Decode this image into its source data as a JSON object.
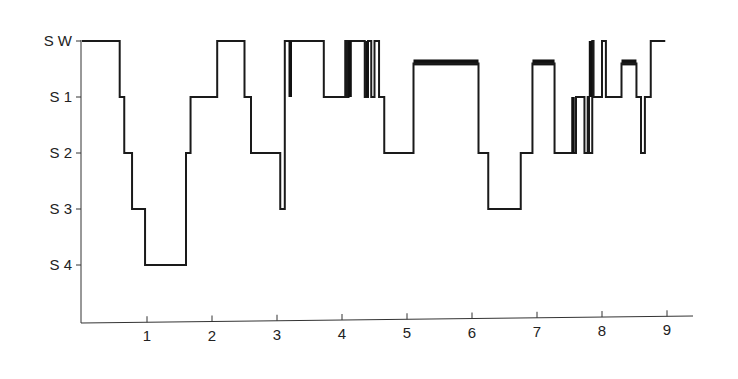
{
  "chart_data": {
    "type": "line",
    "subtype": "step (hypnogram)",
    "title": "",
    "xlabel": "",
    "ylabel": "",
    "x_ticks": [
      1,
      2,
      3,
      4,
      5,
      6,
      7,
      8,
      9
    ],
    "xlim": [
      0,
      9.3
    ],
    "y_categories": [
      "S W",
      "S 1",
      "S 2",
      "S 3",
      "S 4"
    ],
    "y_levels": {
      "S W": 0,
      "S 1": 1,
      "S 2": 2,
      "S 3": 3,
      "S 4": 4
    },
    "grid": false,
    "legend": null,
    "series": [
      {
        "name": "sleep stage",
        "color": "#1a1a1a",
        "steps": [
          [
            0.0,
            0
          ],
          [
            0.58,
            1
          ],
          [
            0.65,
            2
          ],
          [
            0.77,
            3
          ],
          [
            0.97,
            4
          ],
          [
            1.6,
            2
          ],
          [
            1.67,
            1
          ],
          [
            2.08,
            0
          ],
          [
            2.5,
            1
          ],
          [
            2.6,
            2
          ],
          [
            3.05,
            3
          ],
          [
            3.12,
            0
          ],
          [
            3.72,
            1
          ],
          [
            4.05,
            0
          ],
          [
            4.08,
            1
          ],
          [
            4.1,
            0
          ],
          [
            4.35,
            1
          ],
          [
            4.4,
            0
          ],
          [
            4.45,
            1
          ],
          [
            4.5,
            0
          ],
          [
            4.57,
            1
          ],
          [
            4.65,
            2
          ],
          [
            5.1,
            0.4
          ],
          [
            6.1,
            2
          ],
          [
            6.25,
            3
          ],
          [
            6.75,
            2
          ],
          [
            6.93,
            0.4
          ],
          [
            7.27,
            2
          ],
          [
            7.6,
            1
          ],
          [
            7.73,
            2
          ],
          [
            7.78,
            1
          ],
          [
            7.8,
            2
          ],
          [
            7.85,
            0
          ],
          [
            7.87,
            1
          ],
          [
            8.0,
            0
          ],
          [
            8.06,
            1
          ],
          [
            8.3,
            0.4
          ],
          [
            8.53,
            1
          ],
          [
            8.6,
            2
          ],
          [
            8.66,
            1
          ],
          [
            8.75,
            0
          ],
          [
            8.85,
            0
          ]
        ],
        "rem_bars": [
          {
            "x0": 5.1,
            "x1": 6.1,
            "level": 0.4
          },
          {
            "x0": 6.93,
            "x1": 7.27,
            "level": 0.4
          },
          {
            "x0": 8.3,
            "x1": 8.53,
            "level": 0.4
          }
        ],
        "dense_transitions": [
          {
            "x": 3.2,
            "from": 0,
            "to": 1
          },
          {
            "x": 4.12,
            "from": 0,
            "to": 1
          },
          {
            "x": 4.38,
            "from": 0,
            "to": 1
          },
          {
            "x": 7.55,
            "from": 1,
            "to": 2
          },
          {
            "x": 7.82,
            "from": 0,
            "to": 1
          }
        ]
      }
    ]
  },
  "axes": {
    "y_labels": [
      "S W",
      "S 1",
      "S 2",
      "S 3",
      "S 4"
    ],
    "x_labels": [
      "1",
      "2",
      "3",
      "4",
      "5",
      "6",
      "7",
      "8",
      "9"
    ]
  },
  "colors": {
    "line": "#1a1a1a",
    "axis": "#333333",
    "text": "#222222",
    "background": "#ffffff"
  }
}
